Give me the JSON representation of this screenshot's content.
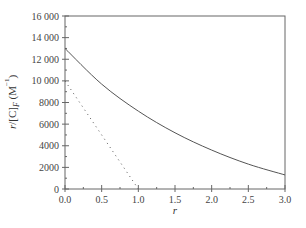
{
  "chart_data": {
    "type": "line",
    "title": "",
    "xlabel": "r",
    "ylabel": "r/[C]F (M⁻¹)",
    "xlim": [
      0,
      3.0
    ],
    "ylim": [
      0,
      16000
    ],
    "x_ticks": [
      "0.0",
      "0.5",
      "1.0",
      "1.5",
      "2.0",
      "2.5",
      "3.0"
    ],
    "y_ticks": [
      "0",
      "2000",
      "4000",
      "6000",
      "8000",
      "10 000",
      "12 000",
      "14 000",
      "16 000"
    ],
    "grid": false,
    "legend": null,
    "series": [
      {
        "name": "solid curve",
        "style": "solid",
        "x": [
          0,
          0.5,
          1.0,
          1.5,
          2.0,
          2.5,
          3.0
        ],
        "values": [
          13000,
          9700,
          7200,
          5200,
          3600,
          2300,
          1300
        ]
      },
      {
        "name": "dotted line",
        "style": "dotted",
        "x": [
          0,
          1.0
        ],
        "values": [
          10000,
          0
        ]
      }
    ]
  },
  "colors": {
    "line": "#555555",
    "axis": "#666666"
  }
}
